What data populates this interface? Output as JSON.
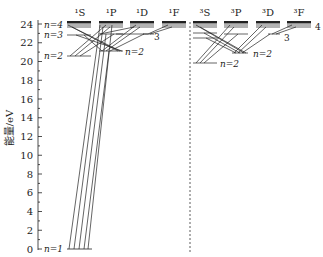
{
  "diagram": {
    "type": "energy-level-diagram",
    "y_axis": {
      "label": "能量/eV",
      "min": 0,
      "max": 24,
      "ticks": [
        0,
        2,
        4,
        6,
        8,
        10,
        12,
        14,
        16,
        18,
        20,
        22,
        24
      ]
    },
    "singlet_terms": [
      "¹S",
      "¹P",
      "¹D",
      "¹F"
    ],
    "triplet_terms": [
      "³S",
      "³P",
      "³D",
      "³F"
    ],
    "level_labels": {
      "n1": "n=1",
      "n2_left": "n=2",
      "n3_left": "n=3",
      "n4_left": "n=4",
      "n2_singlet_P": "n=2",
      "n3_singlet_D": "3",
      "n2_triplet_S": "n=2",
      "n2_triplet_P": "n=2",
      "n3_triplet_D": "3",
      "n4_triplet_F": "4"
    },
    "colors": {
      "line": "#222222",
      "background": "#ffffff"
    }
  }
}
